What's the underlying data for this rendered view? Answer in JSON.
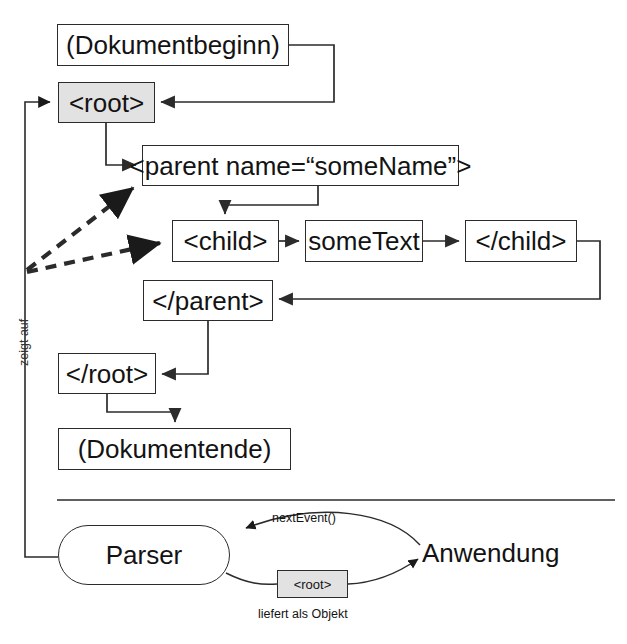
{
  "diagram": {
    "language": "de",
    "colors": {
      "stroke": "#2b2b2b",
      "shaded_fill": "#e2e2e2",
      "background": "#ffffff",
      "text": "#131313"
    },
    "nodes": [
      {
        "id": "doc_start",
        "label": "(Dokumentbeginn)",
        "shape": "rect",
        "shaded": false,
        "x": 57,
        "y": 24,
        "w": 232,
        "h": 42,
        "font": "big-text"
      },
      {
        "id": "root_open",
        "label": "<root>",
        "shape": "rect",
        "shaded": true,
        "x": 58,
        "y": 82,
        "w": 97,
        "h": 41,
        "font": "big-text"
      },
      {
        "id": "parent_open",
        "label": "<parent name=“someName”>",
        "shape": "rect",
        "shaded": false,
        "x": 142,
        "y": 145,
        "w": 317,
        "h": 41,
        "font": "big-text"
      },
      {
        "id": "child_open",
        "label": "<child>",
        "shape": "rect",
        "shaded": false,
        "x": 172,
        "y": 220,
        "w": 107,
        "h": 42,
        "font": "big-text"
      },
      {
        "id": "some_text",
        "label": "someText",
        "shape": "rect",
        "shaded": false,
        "x": 305,
        "y": 220,
        "w": 118,
        "h": 42,
        "font": "big-text"
      },
      {
        "id": "child_close",
        "label": "</child>",
        "shape": "rect",
        "shaded": false,
        "x": 465,
        "y": 220,
        "w": 112,
        "h": 42,
        "font": "big-text"
      },
      {
        "id": "parent_close",
        "label": "</parent>",
        "shape": "rect",
        "shaded": false,
        "x": 143,
        "y": 280,
        "w": 130,
        "h": 41,
        "font": "big-text"
      },
      {
        "id": "root_close",
        "label": "</root>",
        "shape": "rect",
        "shaded": false,
        "x": 58,
        "y": 353,
        "w": 98,
        "h": 41,
        "font": "big-text"
      },
      {
        "id": "doc_end",
        "label": "(Dokumentende)",
        "shape": "rect",
        "shaded": false,
        "x": 58,
        "y": 428,
        "w": 233,
        "h": 42,
        "font": "big-text"
      },
      {
        "id": "parser",
        "label": "Parser",
        "shape": "oval",
        "shaded": false,
        "x": 58,
        "y": 525,
        "w": 172,
        "h": 60,
        "font": "big-text"
      },
      {
        "id": "root_object",
        "label": "<root>",
        "shape": "rect",
        "shaded": true,
        "x": 277,
        "y": 570,
        "w": 71,
        "h": 28,
        "font": "small-text"
      }
    ],
    "labels": [
      {
        "id": "anwendung",
        "text": "Anwendung",
        "x": 422,
        "y": 540,
        "font": "big-text",
        "rotated": false
      },
      {
        "id": "next_event",
        "text": "nextEvent()",
        "x": 272,
        "y": 512,
        "font": "tiny-text",
        "rotated": false
      },
      {
        "id": "liefert_als_objekt",
        "text": "liefert als Objekt",
        "x": 258,
        "y": 608,
        "font": "tiny-text",
        "rotated": false
      },
      {
        "id": "zeigt_auf",
        "text": "zeigt auf",
        "x": 18,
        "y": 366,
        "font": "tiny-text",
        "rotated": true
      }
    ],
    "edges": [
      {
        "id": "doc-start-to-root",
        "from": "doc_start",
        "to": "root_open",
        "style": "solid",
        "label": ""
      },
      {
        "id": "root-to-parent",
        "from": "root_open",
        "to": "parent_open",
        "style": "solid",
        "label": ""
      },
      {
        "id": "parent-to-child",
        "from": "parent_open",
        "to": "child_open",
        "style": "solid",
        "label": ""
      },
      {
        "id": "child-to-sometext",
        "from": "child_open",
        "to": "some_text",
        "style": "solid",
        "label": ""
      },
      {
        "id": "sometext-to-childclose",
        "from": "some_text",
        "to": "child_close",
        "style": "solid",
        "label": ""
      },
      {
        "id": "childclose-to-parentclose",
        "from": "child_close",
        "to": "parent_close",
        "style": "solid",
        "label": ""
      },
      {
        "id": "parentclose-to-rootclose",
        "from": "parent_close",
        "to": "root_close",
        "style": "solid",
        "label": ""
      },
      {
        "id": "rootclose-to-docend",
        "from": "root_close",
        "to": "doc_end",
        "style": "solid",
        "label": ""
      },
      {
        "id": "cursor-to-root",
        "from": "parser",
        "to": "root_open",
        "style": "solid",
        "label": "zeigt auf"
      },
      {
        "id": "cursor-to-parent",
        "from": "parser",
        "to": "parent_open",
        "style": "dashed",
        "label": ""
      },
      {
        "id": "cursor-to-child",
        "from": "parser",
        "to": "child_open",
        "style": "dashed",
        "label": ""
      },
      {
        "id": "app-to-parser",
        "from": "anwendung",
        "to": "parser",
        "style": "solid",
        "label": "nextEvent()"
      },
      {
        "id": "parser-to-app",
        "from": "parser",
        "to": "anwendung",
        "style": "solid",
        "label": "liefert als Objekt"
      }
    ]
  }
}
